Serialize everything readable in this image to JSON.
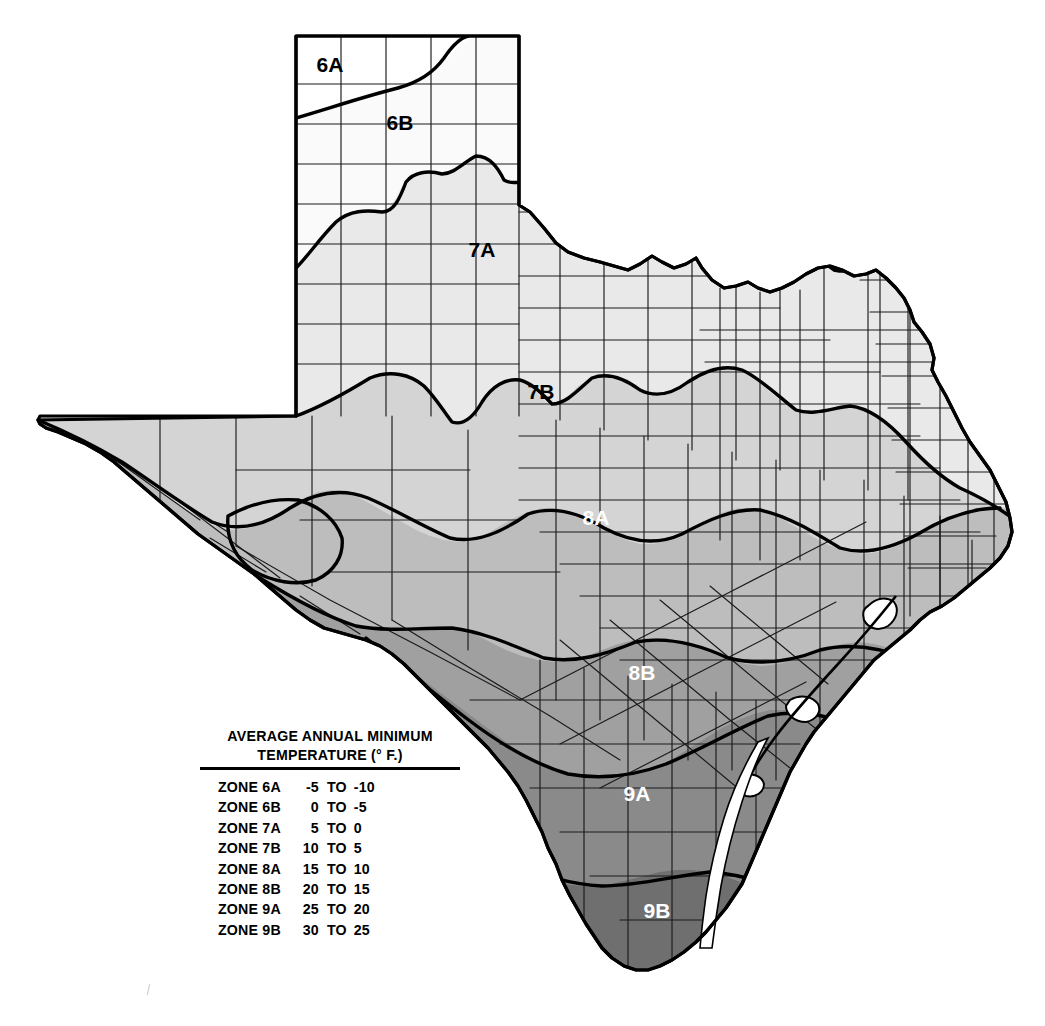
{
  "map": {
    "title": "Texas Plant Hardiness Zone Map",
    "zone_labels": [
      {
        "id": "6A",
        "text": "6A",
        "x": 330,
        "y": 72,
        "contrast": "dark"
      },
      {
        "id": "6B",
        "text": "6B",
        "x": 400,
        "y": 130,
        "contrast": "dark"
      },
      {
        "id": "7A",
        "text": "7A",
        "x": 482,
        "y": 257,
        "contrast": "dark"
      },
      {
        "id": "7B",
        "text": "7B",
        "x": 541,
        "y": 399,
        "contrast": "dark"
      },
      {
        "id": "8A",
        "text": "8A",
        "x": 596,
        "y": 525,
        "contrast": "light"
      },
      {
        "id": "8B",
        "text": "8B",
        "x": 642,
        "y": 680,
        "contrast": "light"
      },
      {
        "id": "9A",
        "text": "9A",
        "x": 637,
        "y": 801,
        "contrast": "light"
      },
      {
        "id": "9B",
        "text": "9B",
        "x": 657,
        "y": 918,
        "contrast": "light"
      }
    ],
    "zone_fills": {
      "6A": "#ffffff",
      "6B": "#fafafa",
      "7A": "#e9e9e9",
      "7B": "#d4d4d4",
      "8A": "#bdbdbd",
      "8B": "#a0a0a0",
      "9A": "#8a8a8a",
      "9B": "#6f6f6f"
    },
    "line_colors": {
      "county_border": "#1a1a1a",
      "zone_border": "#000000",
      "state_outline": "#000000",
      "background": "#ffffff"
    }
  },
  "legend": {
    "title_line_1": "AVERAGE ANNUAL MINIMUM",
    "title_line_2": "TEMPERATURE (° F.)",
    "columns": [
      "zone",
      "high",
      "to",
      "low"
    ],
    "rows": [
      {
        "zone": "ZONE 6A",
        "high": "-5",
        "to": "TO",
        "low": "-10"
      },
      {
        "zone": "ZONE 6B",
        "high": "0",
        "to": "TO",
        "low": "-5"
      },
      {
        "zone": "ZONE 7A",
        "high": "5",
        "to": "TO",
        "low": "0"
      },
      {
        "zone": "ZONE 7B",
        "high": "10",
        "to": "TO",
        "low": "5"
      },
      {
        "zone": "ZONE 8A",
        "high": "15",
        "to": "TO",
        "low": "10"
      },
      {
        "zone": "ZONE 8B",
        "high": "20",
        "to": "TO",
        "low": "15"
      },
      {
        "zone": "ZONE 9A",
        "high": "25",
        "to": "TO",
        "low": "20"
      },
      {
        "zone": "ZONE 9B",
        "high": "30",
        "to": "TO",
        "low": "25"
      }
    ]
  }
}
